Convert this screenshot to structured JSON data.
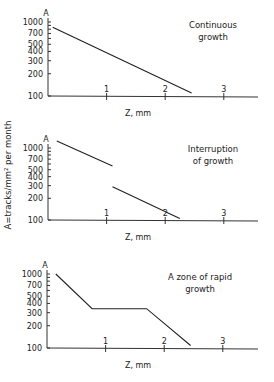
{
  "figure": {
    "shared_ylabel": "A=tracks/mm² per month",
    "shared_xlabel": "Z,    mm"
  },
  "chart_data": [
    {
      "type": "line",
      "title": "Continuous growth",
      "annotation_lines": [
        "Continuous",
        "growth"
      ],
      "xlabel": "Z,    mm",
      "ylabel": "A",
      "yscale": "log",
      "ylim": [
        100,
        1000
      ],
      "xlim": [
        0,
        3.5
      ],
      "x_ticks": [
        1,
        2,
        3
      ],
      "y_ticks": [
        100,
        200,
        300,
        400,
        500,
        700,
        1000
      ],
      "series": [
        {
          "name": "segment-1",
          "x": [
            0.08,
            2.45
          ],
          "y": [
            850,
            110
          ]
        }
      ]
    },
    {
      "type": "line",
      "title": "Interruption of growth",
      "annotation_lines": [
        "Interruption",
        "of growth"
      ],
      "xlabel": "Z,    mm",
      "ylabel": "A",
      "yscale": "log",
      "ylim": [
        100,
        1000
      ],
      "xlim": [
        0,
        3.5
      ],
      "x_ticks": [
        1,
        2,
        3
      ],
      "y_ticks": [
        100,
        200,
        300,
        400,
        500,
        700,
        1000
      ],
      "series": [
        {
          "name": "before-interruption",
          "x": [
            0.15,
            1.1
          ],
          "y": [
            1250,
            560
          ]
        },
        {
          "name": "after-interruption",
          "x": [
            1.1,
            2.25
          ],
          "y": [
            290,
            105
          ]
        }
      ]
    },
    {
      "type": "line",
      "title": "A zone of rapid growth",
      "annotation_lines": [
        "A zone of rapid",
        "growth"
      ],
      "xlabel": "Z,    mm",
      "ylabel": "A",
      "yscale": "log",
      "ylim": [
        100,
        1000
      ],
      "xlim": [
        0,
        3.5
      ],
      "x_ticks": [
        1,
        2,
        3
      ],
      "y_ticks": [
        100,
        200,
        300,
        400,
        500,
        700,
        1000
      ],
      "series": [
        {
          "name": "segment-1",
          "x": [
            0.15,
            0.77,
            1.7,
            2.45
          ],
          "y": [
            1000,
            340,
            340,
            108
          ]
        }
      ]
    }
  ]
}
